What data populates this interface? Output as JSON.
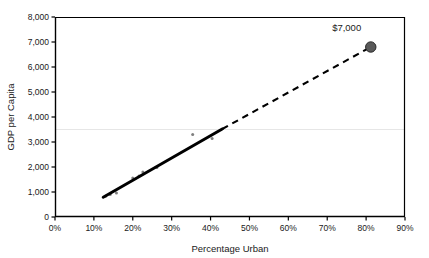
{
  "chart_data": {
    "type": "scatter",
    "title": "",
    "subtitle": "",
    "xlabel": "Percentage Urban",
    "ylabel": "GDP per Capita",
    "xlim": [
      0,
      90
    ],
    "ylim": [
      0,
      8000
    ],
    "grid": "single faint horizontal gridline near 3,500",
    "legend": "none",
    "x_tick_labels": [
      "0%",
      "10%",
      "20%",
      "30%",
      "40%",
      "50%",
      "60%",
      "70%",
      "80%",
      "90%"
    ],
    "x_tick_values": [
      0,
      10,
      20,
      30,
      40,
      50,
      60,
      70,
      80,
      90
    ],
    "y_tick_labels": [
      "0",
      "1,000",
      "2,000",
      "3,000",
      "4,000",
      "5,000",
      "6,000",
      "7,000",
      "8,000"
    ],
    "y_tick_values": [
      0,
      1000,
      2000,
      3000,
      4000,
      5000,
      6000,
      7000,
      8000
    ],
    "series": [
      {
        "name": "Observed countries",
        "type": "scatter",
        "marker": "small gray dot",
        "color": "#7f7f7f",
        "points": [
          {
            "x": 13.0,
            "y": 830
          },
          {
            "x": 14.2,
            "y": 900
          },
          {
            "x": 15.8,
            "y": 960
          },
          {
            "x": 20.0,
            "y": 1560
          },
          {
            "x": 21.6,
            "y": 1640
          },
          {
            "x": 22.6,
            "y": 1800
          },
          {
            "x": 26.2,
            "y": 1980
          },
          {
            "x": 35.4,
            "y": 3300
          },
          {
            "x": 40.4,
            "y": 3140
          }
        ]
      },
      {
        "name": "Fitted trend (observed range)",
        "type": "line",
        "style": "solid",
        "color": "#000000",
        "points": [
          {
            "x": 12.4,
            "y": 790
          },
          {
            "x": 43.0,
            "y": 3520
          }
        ]
      },
      {
        "name": "Extrapolated trend",
        "type": "line",
        "style": "dashed",
        "color": "#000000",
        "points": [
          {
            "x": 43.0,
            "y": 3520
          },
          {
            "x": 81.2,
            "y": 6800
          }
        ]
      },
      {
        "name": "Extrapolated prediction",
        "type": "scatter",
        "marker": "large dark gray filled circle",
        "color": "#595959",
        "points": [
          {
            "x": 81.2,
            "y": 6800,
            "label": "$7,000"
          }
        ]
      }
    ],
    "annotations": [
      {
        "text": "$7,000",
        "x": 75.0,
        "y": 7450,
        "anchor": "middle"
      }
    ],
    "gridlines_y": [
      3500
    ]
  },
  "colors": {
    "axis": "#000000",
    "plot_background": "#ffffff",
    "point": "#7f7f7f",
    "highlight_point": "#595959",
    "gridline": "#e6e6e6",
    "trend_line": "#000000"
  }
}
